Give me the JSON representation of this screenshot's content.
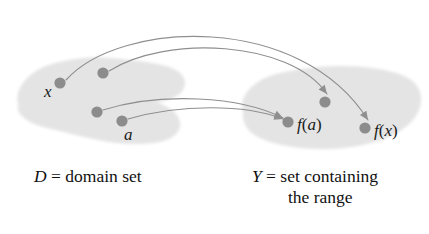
{
  "figure": {
    "background_color": "#ffffff",
    "blob_color": "#e4e4e4",
    "dot_color": "#8c8c8c",
    "arrow_color": "#8f8f8f",
    "label_color": "#1a1a1a"
  },
  "domain_set": {
    "caption_symbol": "D",
    "caption_equals": " = ",
    "caption_words": "domain set",
    "caption_full": "D = domain set",
    "points": [
      {
        "id": "x",
        "label": "x",
        "label_visible": true,
        "cx": 60,
        "cy": 83,
        "r": 5.6,
        "label_x": 44,
        "label_y": 97
      },
      {
        "id": "p2",
        "label": "",
        "label_visible": false,
        "cx": 103,
        "cy": 73,
        "r": 5.6,
        "label_x": 0,
        "label_y": 0
      },
      {
        "id": "p3",
        "label": "",
        "label_visible": false,
        "cx": 97,
        "cy": 112,
        "r": 5.6,
        "label_x": 0,
        "label_y": 0
      },
      {
        "id": "a",
        "label": "a",
        "label_visible": true,
        "cx": 122,
        "cy": 121,
        "r": 5.6,
        "label_x": 124,
        "label_y": 140
      }
    ]
  },
  "range_set": {
    "caption_symbol": "Y",
    "caption_equals": " = ",
    "caption_line_one": "set containing",
    "caption_line_two": "the range",
    "caption_full": "Y = set containing the range",
    "points": [
      {
        "id": "fp2",
        "label": "",
        "label_visible": false,
        "cx": 325,
        "cy": 102,
        "r": 5.6,
        "label_x": 0,
        "label_y": 0
      },
      {
        "id": "fa",
        "label": "f(a)",
        "label_visible": true,
        "cx": 288,
        "cy": 122,
        "r": 5.6,
        "label_x": 297,
        "label_y": 130
      },
      {
        "id": "fx",
        "label": "f(x)",
        "label_visible": true,
        "cx": 365,
        "cy": 128,
        "r": 5.6,
        "label_x": 374,
        "label_y": 136
      }
    ]
  },
  "arrows": [
    {
      "id": "arrow-x-to-fx",
      "from": "x",
      "to": "fx",
      "path": "M 66 80 C 120 20 300 12 368 120"
    },
    {
      "id": "arrow-p2-to-fp2",
      "from": "p2",
      "to": "fp2",
      "path": "M 109 71 C 165 35 290 40 327 94"
    },
    {
      "id": "arrow-p3-to-fa",
      "from": "p3",
      "to": "fa",
      "path": "M 103 110 C 160 92 240 96 283 118"
    },
    {
      "id": "arrow-a-to-fa",
      "from": "a",
      "to": "fa",
      "path": "M 128 119 C 180 104 245 104 283 119"
    }
  ],
  "blobs": {
    "domain_path": "M 18 104 C 14 88 30 70 52 64 C 70 59 92 56 112 58 C 132 60 150 62 166 66 C 180 70 188 78 184 88 C 180 97 168 101 156 102 C 168 106 178 112 180 122 C 182 133 170 141 154 143 C 136 145 116 144 98 140 C 82 137 68 133 56 130 C 40 127 26 122 20 114 C 17 110 18 107 18 104 Z",
    "range_path": "M 243 112 C 238 96 254 80 276 74 C 296 69 318 66 340 66 C 364 66 388 69 404 76 C 418 82 424 94 420 107 C 416 121 402 132 384 139 C 364 146 340 150 316 149 C 292 148 270 144 256 136 C 246 130 242 121 243 112 Z"
  }
}
